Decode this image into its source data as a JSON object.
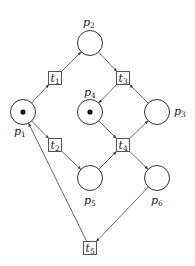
{
  "diagram": {
    "type": "petri-net",
    "places": [
      {
        "id": "p1",
        "label": "p",
        "sub": "1",
        "cx": 23,
        "cy": 112,
        "tokens": 1,
        "lx": 14,
        "ly": 135
      },
      {
        "id": "p2",
        "label": "p",
        "sub": "2",
        "cx": 90,
        "cy": 43,
        "tokens": 0,
        "lx": 83,
        "ly": 26
      },
      {
        "id": "p3",
        "label": "p",
        "sub": "3",
        "cx": 157,
        "cy": 112,
        "tokens": 0,
        "lx": 174,
        "ly": 115
      },
      {
        "id": "p4",
        "label": "p",
        "sub": "4",
        "cx": 90,
        "cy": 112,
        "tokens": 1,
        "lx": 84,
        "ly": 96
      },
      {
        "id": "p5",
        "label": "p",
        "sub": "5",
        "cx": 90,
        "cy": 178,
        "tokens": 0,
        "lx": 84,
        "ly": 204
      },
      {
        "id": "p6",
        "label": "p",
        "sub": "6",
        "cx": 157,
        "cy": 178,
        "tokens": 0,
        "lx": 151,
        "ly": 204
      }
    ],
    "transitions": [
      {
        "id": "t1",
        "label": "t",
        "sub": "1",
        "cx": 55,
        "cy": 78
      },
      {
        "id": "t2",
        "label": "t",
        "sub": "2",
        "cx": 55,
        "cy": 145
      },
      {
        "id": "t3",
        "label": "t",
        "sub": "3",
        "cx": 123,
        "cy": 78
      },
      {
        "id": "t4",
        "label": "t",
        "sub": "4",
        "cx": 123,
        "cy": 145
      },
      {
        "id": "t5",
        "label": "t",
        "sub": "5",
        "cx": 90,
        "cy": 248
      }
    ],
    "arcs": [
      {
        "from": "p1",
        "to": "t1"
      },
      {
        "from": "t1",
        "to": "p2"
      },
      {
        "from": "p2",
        "to": "t3"
      },
      {
        "from": "t3",
        "to": "p4"
      },
      {
        "from": "p3",
        "to": "t3"
      },
      {
        "from": "p1",
        "to": "t2"
      },
      {
        "from": "t2",
        "to": "p5"
      },
      {
        "from": "p4",
        "to": "t4"
      },
      {
        "from": "p5",
        "to": "t4"
      },
      {
        "from": "t4",
        "to": "p3"
      },
      {
        "from": "t4",
        "to": "p6"
      },
      {
        "from": "p6",
        "to": "t5"
      },
      {
        "from": "t5",
        "to": "p1"
      }
    ],
    "place_radius": 12.5,
    "transition_size": 13
  }
}
